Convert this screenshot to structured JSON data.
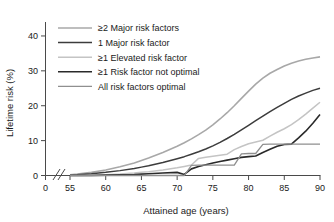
{
  "chart_data": {
    "type": "line",
    "title": "",
    "xlabel": "Attained age (years)",
    "ylabel": "Lifetime risk (%)",
    "xlim": [
      55,
      90
    ],
    "ylim": [
      0,
      44
    ],
    "xticks": [
      0,
      55,
      60,
      65,
      70,
      75,
      80,
      85,
      90
    ],
    "yticks": [
      0,
      10,
      20,
      30,
      40
    ],
    "xtick_labels": [
      "0",
      "55",
      "60",
      "65",
      "70",
      "75",
      "80",
      "85",
      "90"
    ],
    "ytick_labels": [
      "0",
      "10",
      "20",
      "30",
      "40"
    ],
    "axis_break": true,
    "axis_break_note": "x-axis broken between 0 and 55",
    "grid": false,
    "legend_position": "upper left",
    "x": [
      55,
      56,
      58,
      60,
      62,
      64,
      65,
      66,
      68,
      70,
      71,
      72,
      73,
      74,
      75,
      76,
      77,
      78,
      79,
      80,
      81,
      82,
      83,
      84,
      85,
      86,
      87,
      88,
      89,
      90
    ],
    "series": [
      {
        "name": "≥2 Major risk factors",
        "color": "#a8a8a8",
        "width": 1.6,
        "values": [
          0.2,
          0.4,
          0.9,
          1.6,
          2.5,
          3.6,
          4.3,
          5.0,
          6.6,
          8.4,
          9.4,
          10.5,
          11.7,
          13.0,
          14.5,
          16.2,
          18.0,
          20.0,
          22.1,
          24.2,
          26.2,
          27.9,
          29.3,
          30.4,
          31.4,
          32.2,
          32.8,
          33.3,
          33.7,
          34.0
        ]
      },
      {
        "name": "1 Major risk factor",
        "color": "#3c3c3c",
        "width": 1.5,
        "values": [
          0.1,
          0.2,
          0.5,
          0.9,
          1.4,
          2.0,
          2.4,
          2.8,
          3.7,
          4.8,
          5.4,
          6.1,
          6.8,
          7.6,
          8.5,
          9.5,
          10.6,
          11.8,
          13.1,
          14.4,
          15.7,
          17.0,
          18.3,
          19.5,
          20.7,
          21.8,
          22.8,
          23.6,
          24.4,
          25.0
        ]
      },
      {
        "name": "≥1 Elevated risk factor",
        "color": "#c4c4c4",
        "width": 1.5,
        "values": [
          0.0,
          0.0,
          0.1,
          0.2,
          0.4,
          0.7,
          0.9,
          1.1,
          1.6,
          2.2,
          2.6,
          3.0,
          4.9,
          5.2,
          5.5,
          5.8,
          6.1,
          7.4,
          8.3,
          9.1,
          9.6,
          10.1,
          11.3,
          12.4,
          13.4,
          14.6,
          16.0,
          17.6,
          19.3,
          21.0
        ]
      },
      {
        "name": "≥1 Risk factor not optimal",
        "color": "#2a2a2a",
        "width": 1.6,
        "values": [
          0.0,
          0.0,
          0.0,
          0.1,
          0.2,
          0.3,
          0.4,
          0.5,
          0.7,
          0.9,
          0.3,
          1.9,
          2.6,
          3.1,
          3.6,
          4.0,
          4.4,
          4.8,
          5.2,
          5.4,
          5.6,
          6.6,
          7.5,
          8.4,
          8.9,
          9.0,
          10.8,
          12.7,
          15.0,
          17.5
        ]
      },
      {
        "name": "All risk factors optimal",
        "color": "#8f8f8f",
        "width": 1.3,
        "values": [
          0.0,
          0.0,
          0.0,
          0.0,
          0.0,
          0.0,
          0.0,
          0.0,
          0.0,
          0.0,
          0.0,
          2.9,
          3.0,
          3.0,
          3.0,
          3.0,
          3.0,
          3.0,
          6.2,
          6.3,
          6.3,
          8.9,
          9.0,
          9.0,
          9.0,
          9.0,
          9.0,
          9.0,
          9.0,
          9.0
        ]
      }
    ]
  },
  "legend": {
    "items": [
      {
        "label": "≥2 Major risk factors"
      },
      {
        "label": "1 Major risk factor"
      },
      {
        "label": "≥1 Elevated risk factor"
      },
      {
        "label": "≥1 Risk factor not optimal"
      },
      {
        "label": "All risk factors optimal"
      }
    ]
  }
}
